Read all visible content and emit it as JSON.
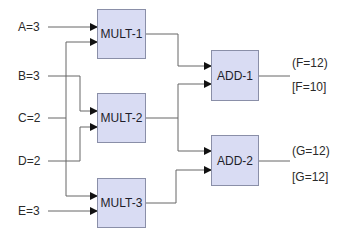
{
  "colors": {
    "block_fill": "#d9dcf3",
    "block_border": "#8a8fa8",
    "wire": "#555555",
    "arrow": "#111111",
    "text": "#2a2a2a"
  },
  "inputs": [
    {
      "label": "A=3"
    },
    {
      "label": "B=3"
    },
    {
      "label": "C=2"
    },
    {
      "label": "D=2"
    },
    {
      "label": "E=3"
    }
  ],
  "blocks": {
    "mult1": {
      "label": "MULT-1"
    },
    "mult2": {
      "label": "MULT-2"
    },
    "mult3": {
      "label": "MULT-3"
    },
    "add1": {
      "label": "ADD-1"
    },
    "add2": {
      "label": "ADD-2"
    }
  },
  "outputs": {
    "f": {
      "expected": "(F=12)",
      "actual": "[F=10]"
    },
    "g": {
      "expected": "(G=12)",
      "actual": "[G=12]"
    }
  }
}
